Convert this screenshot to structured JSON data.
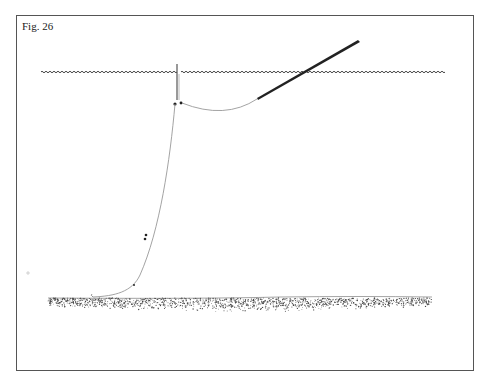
{
  "figure": {
    "label": "Fig. 26",
    "elements": [
      {
        "name": "water-surface",
        "type": "wavy-line"
      },
      {
        "name": "rod",
        "type": "tapered-stroke"
      },
      {
        "name": "line-rod-to-float",
        "type": "curve"
      },
      {
        "name": "float",
        "type": "vertical-stick"
      },
      {
        "name": "line-float-to-bed",
        "type": "curve",
        "shots": 3
      },
      {
        "name": "river-bed",
        "type": "stippled-band"
      }
    ]
  },
  "colors": {
    "border": "#555555",
    "ink": "#222222",
    "line": "#888888",
    "bed_dots": "#444444"
  }
}
